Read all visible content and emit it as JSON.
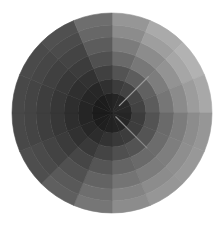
{
  "figure": {
    "type": "grayscale-radial-sector-wheel",
    "center": [
      112,
      113
    ],
    "radius": 100,
    "background": "#ffffff",
    "sectors": 16,
    "rings": [
      0,
      20,
      34,
      48,
      62,
      76,
      88,
      100
    ],
    "start_angle_deg": -90,
    "sector_base_gray": [
      150,
      170,
      178,
      168,
      150,
      152,
      150,
      140,
      118,
      95,
      78,
      72,
      72,
      74,
      80,
      110
    ],
    "center_gray": 22,
    "ring_weights": [
      0.12,
      0.3,
      0.48,
      0.66,
      0.8,
      0.92,
      1.0
    ],
    "highlight_lines": [
      {
        "angle_deg": -45,
        "from": 10,
        "to": 52,
        "color": "#9a9a9a"
      },
      {
        "angle_deg": 45,
        "from": 5,
        "to": 50,
        "color": "#8a8a8a"
      }
    ]
  }
}
